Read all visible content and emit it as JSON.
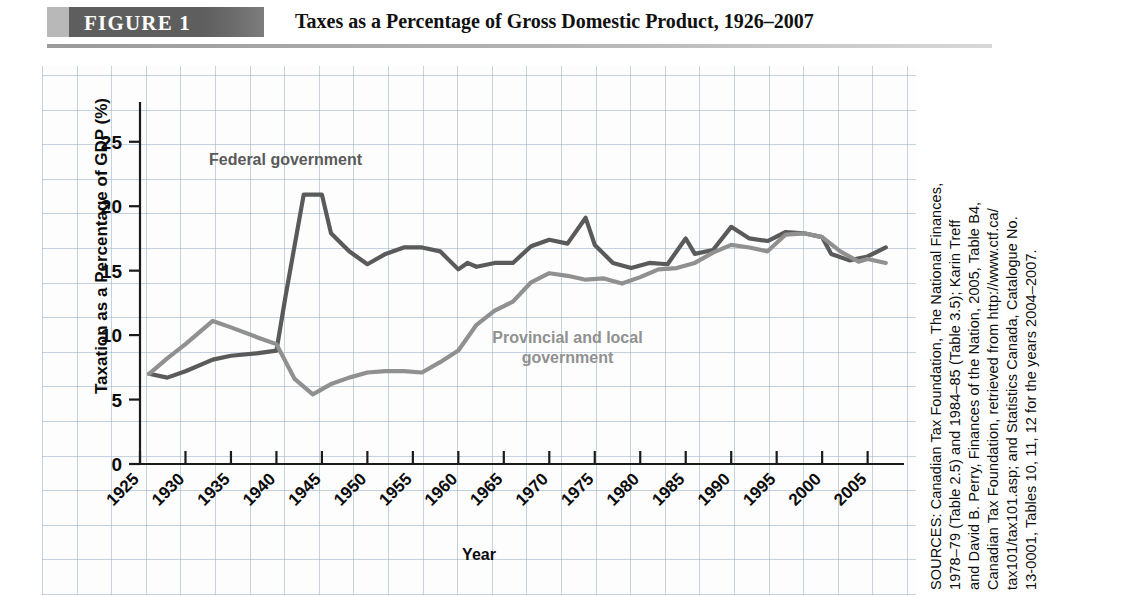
{
  "header": {
    "figure_label": "FIGURE 1",
    "title": "Taxes as a Percentage of Gross Domestic Product, 1926–2007"
  },
  "sources": {
    "lines": [
      "SOURCES: Canadian Tax Foundation, The National Finances,",
      "1978–79 (Table 2.5) and 1984–85 (Table 3.5); Karin Treff",
      "and David B. Perry, Finances of the Nation, 2005, Table B4,",
      "Canadian Tax Foundation, retrieved from http://www.ctf.ca/",
      "tax101/tax101.asp; and Statistics Canada, Catalogue No.",
      "13-0001, Tables 10, 11, 12 for the years 2004–2007."
    ]
  },
  "chart_data": {
    "type": "line",
    "title": "Taxes as a Percentage of Gross Domestic Product, 1926–2007",
    "xlabel": "Year",
    "ylabel": "Taxation as a Percentage of GDP (%)",
    "xlim": [
      1925,
      2009
    ],
    "ylim": [
      0,
      27
    ],
    "yticks": [
      0,
      5,
      10,
      15,
      20,
      25
    ],
    "xticks": [
      1925,
      1930,
      1935,
      1940,
      1945,
      1950,
      1955,
      1960,
      1965,
      1970,
      1975,
      1980,
      1985,
      1990,
      1995,
      2000,
      2005
    ],
    "grid": true,
    "legend_position": "inline-annotations",
    "series": [
      {
        "name": "Federal government",
        "color": "#5a5a5a",
        "label_x": 1941,
        "label_y": 23.2,
        "x": [
          1926,
          1928,
          1930,
          1933,
          1935,
          1938,
          1940,
          1941,
          1943,
          1945,
          1946,
          1948,
          1950,
          1952,
          1954,
          1956,
          1958,
          1960,
          1961,
          1962,
          1964,
          1966,
          1968,
          1970,
          1972,
          1974,
          1975,
          1977,
          1979,
          1981,
          1983,
          1985,
          1986,
          1988,
          1990,
          1992,
          1994,
          1996,
          1998,
          2000,
          2001,
          2003,
          2005,
          2007
        ],
        "y": [
          7.0,
          6.7,
          7.2,
          8.1,
          8.4,
          8.6,
          8.8,
          13.0,
          20.9,
          20.9,
          17.9,
          16.5,
          15.5,
          16.3,
          16.8,
          16.8,
          16.5,
          15.1,
          15.6,
          15.3,
          15.6,
          15.6,
          16.9,
          17.4,
          17.1,
          19.1,
          17.0,
          15.6,
          15.2,
          15.6,
          15.5,
          17.5,
          16.3,
          16.6,
          18.4,
          17.5,
          17.3,
          18.0,
          17.9,
          17.6,
          16.3,
          15.8,
          16.1,
          16.8
        ]
      },
      {
        "name": "Provincial and local government",
        "color": "#909090",
        "label_x": 1972,
        "label_y": 9.4,
        "x": [
          1926,
          1928,
          1930,
          1933,
          1935,
          1938,
          1940,
          1942,
          1944,
          1946,
          1948,
          1950,
          1952,
          1954,
          1956,
          1958,
          1960,
          1962,
          1964,
          1966,
          1968,
          1970,
          1972,
          1974,
          1976,
          1978,
          1980,
          1982,
          1984,
          1986,
          1988,
          1990,
          1992,
          1994,
          1996,
          1998,
          2000,
          2002,
          2004,
          2005,
          2007
        ],
        "y": [
          7.0,
          8.2,
          9.3,
          11.1,
          10.6,
          9.8,
          9.3,
          6.6,
          5.4,
          6.2,
          6.7,
          7.1,
          7.2,
          7.2,
          7.1,
          7.9,
          8.8,
          10.8,
          11.9,
          12.6,
          14.1,
          14.8,
          14.6,
          14.3,
          14.4,
          14.0,
          14.5,
          15.1,
          15.2,
          15.6,
          16.4,
          17.0,
          16.8,
          16.5,
          17.8,
          17.9,
          17.6,
          16.5,
          15.7,
          15.9,
          15.6
        ]
      }
    ]
  }
}
